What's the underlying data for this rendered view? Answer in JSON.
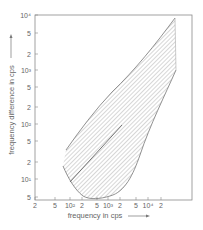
{
  "chart_data": {
    "type": "area",
    "title": "",
    "xlabel": "frequency in cps",
    "ylabel": "frequency difference in cps",
    "x_scale": "log",
    "y_scale": "log",
    "xlim": [
      20,
      20000
    ],
    "ylim": [
      5,
      10000
    ],
    "x_ticks": [
      "2",
      "5",
      "10²",
      "2",
      "5",
      "10³",
      "2",
      "5",
      "10⁴",
      "2"
    ],
    "y_ticks": [
      "10⁴",
      "5",
      "2",
      "10³",
      "5",
      "2",
      "10²",
      "5",
      "2",
      "10¹",
      "5"
    ],
    "grid": false,
    "legend": null,
    "series": [
      {
        "name": "hatched region upper boundary",
        "x": [
          80,
          150,
          300,
          600,
          1200,
          2500,
          5000,
          8000
        ],
        "y": [
          40,
          110,
          250,
          500,
          1000,
          2200,
          5000,
          8000
        ]
      },
      {
        "name": "hatched region lower boundary",
        "x": [
          70,
          100,
          200,
          400,
          700,
          1100,
          1600,
          2500,
          5000,
          8000
        ],
        "y": [
          22,
          15,
          10,
          8.5,
          9,
          11,
          20,
          60,
          400,
          1000
        ]
      },
      {
        "name": "straight line (f_diff = f)",
        "x": [
          90,
          1000
        ],
        "y": [
          9,
          100
        ]
      }
    ]
  },
  "axes": {
    "x_title": "frequency in cps",
    "y_title": "frequency difference in cps",
    "x_ticks": [
      {
        "label": "2",
        "pos": 35
      },
      {
        "label": "5",
        "pos": 55
      },
      {
        "label": "10²",
        "pos": 70
      },
      {
        "label": "2",
        "pos": 82
      },
      {
        "label": "5",
        "pos": 97
      },
      {
        "label": "10³",
        "pos": 108
      },
      {
        "label": "2",
        "pos": 120
      },
      {
        "label": "5",
        "pos": 136
      },
      {
        "label": "10⁴",
        "pos": 148
      },
      {
        "label": "2",
        "pos": 161
      }
    ],
    "y_ticks": [
      {
        "label": "10⁴",
        "pos": 15
      },
      {
        "label": "5",
        "pos": 33
      },
      {
        "label": "2",
        "pos": 54
      },
      {
        "label": "10³",
        "pos": 70
      },
      {
        "label": "5",
        "pos": 87
      },
      {
        "label": "2",
        "pos": 107
      },
      {
        "label": "10²",
        "pos": 124
      },
      {
        "label": "5",
        "pos": 141
      },
      {
        "label": "2",
        "pos": 162
      },
      {
        "label": "10¹",
        "pos": 179
      },
      {
        "label": "5",
        "pos": 197
      }
    ]
  },
  "colors": {
    "frame": "#888888",
    "curve": "#777777",
    "hatch": "#999999",
    "text": "#666666"
  }
}
